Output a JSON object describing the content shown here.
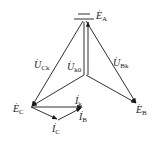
{
  "diagram": {
    "type": "phasor-diagram",
    "line_color": "#1a1a1a",
    "points": {
      "A": [
        84,
        21
      ],
      "O": [
        84,
        75
      ],
      "B": [
        137,
        104
      ],
      "C": [
        31,
        107
      ],
      "Ik_end": [
        82,
        107
      ],
      "IC_mid": [
        58,
        120
      ]
    },
    "labels": {
      "EA": {
        "base": "E",
        "sub": "A"
      },
      "EB": {
        "base": "E",
        "sub": "B"
      },
      "EC": {
        "base": "E",
        "sub": "C"
      },
      "UCk": {
        "base": "U",
        "sub": "Ck"
      },
      "UBk": {
        "base": "U",
        "sub": "Bk"
      },
      "Uk0": {
        "base": "U",
        "sub": "k0"
      },
      "Ik": {
        "base": "I",
        "sub": "k"
      },
      "IB": {
        "base": "I",
        "sub": "B"
      },
      "IC": {
        "base": "I",
        "sub": "C"
      }
    },
    "dot_glyph": "·"
  }
}
